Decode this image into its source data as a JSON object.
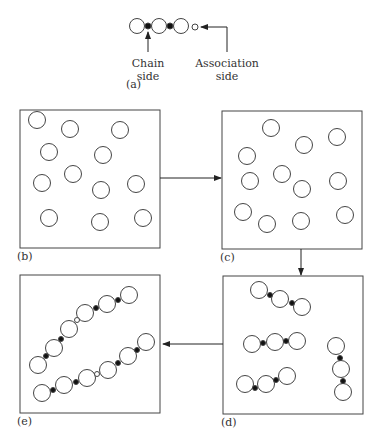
{
  "panel_a": {
    "label": "(a)",
    "chain_label_line1": "Chain",
    "chain_label_line2": "side",
    "assoc_label_line1": "Association",
    "assoc_label_line2": "side"
  },
  "panels": {
    "b": {
      "label": "(b)"
    },
    "c": {
      "label": "(c)"
    },
    "d": {
      "label": "(d)"
    },
    "e": {
      "label": "(e)"
    }
  },
  "colors": {
    "stroke": "#444444",
    "filled_dot": "#111111",
    "background": "#ffffff"
  }
}
